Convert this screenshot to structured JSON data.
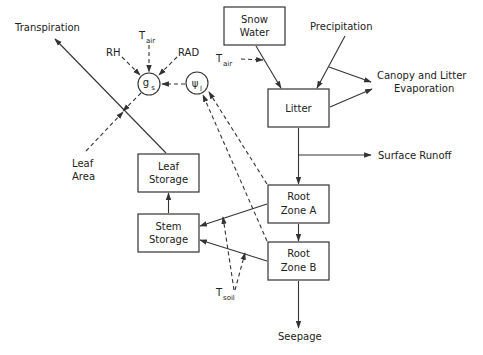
{
  "diagram": {
    "boxes": {
      "snow_water": [
        "Snow",
        "Water"
      ],
      "litter": [
        "Litter"
      ],
      "root_zone_a": [
        "Root",
        "Zone A"
      ],
      "root_zone_b": [
        "Root",
        "Zone B"
      ],
      "leaf_storage": [
        "Leaf",
        "Storage"
      ],
      "stem_storage": [
        "Stem",
        "Storage"
      ]
    },
    "nodes": {
      "gs": {
        "main": "g",
        "sub": "s"
      },
      "psi": {
        "main": "ψ",
        "sub": "l"
      }
    },
    "labels": {
      "transpiration": "Transpiration",
      "precipitation": "Precipitation",
      "canopy_evap_1": "Canopy and Litter",
      "canopy_evap_2": "Evaporation",
      "surface_runoff": "Surface Runoff",
      "seepage": "Seepage",
      "rh": "RH",
      "rad": "RAD",
      "leaf_area_1": "Leaf",
      "leaf_area_2": "Area",
      "t_air_gs": {
        "main": "T",
        "sub": "air"
      },
      "t_air_snow": {
        "main": "T",
        "sub": "air"
      },
      "t_soil": {
        "main": "T",
        "sub": "soil"
      }
    }
  }
}
